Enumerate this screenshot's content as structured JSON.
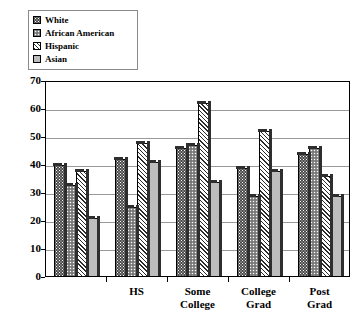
{
  "chart_data": {
    "type": "bar",
    "title": "",
    "subtitle": "",
    "xlabel": "",
    "ylabel": "",
    "categories": [
      "<HS",
      "HS",
      "Some College",
      "College Grad",
      "Post Grad"
    ],
    "category_lines": [
      [
        "<HS"
      ],
      [
        "HS"
      ],
      [
        "Some",
        "College"
      ],
      [
        "College",
        "Grad"
      ],
      [
        "Post",
        "Grad"
      ]
    ],
    "series": [
      {
        "name": "White",
        "pattern": "dark-dotted",
        "values": [
          40,
          42,
          46,
          39,
          44
        ]
      },
      {
        "name": "African American",
        "pattern": "medium-dotted",
        "values": [
          33,
          25,
          47,
          29,
          46
        ]
      },
      {
        "name": "Hispanic",
        "pattern": "diagonal-hatch",
        "values": [
          38,
          48,
          62,
          52,
          36
        ]
      },
      {
        "name": "Asian",
        "pattern": "solid-gray",
        "values": [
          21,
          41,
          34,
          38,
          29
        ]
      }
    ],
    "ylim": [
      0,
      70
    ],
    "yticks": [
      0,
      10,
      20,
      30,
      40,
      50,
      60,
      70
    ],
    "ytick_labels": [
      "0",
      "10",
      "20",
      "30",
      "40",
      "50",
      "60",
      "70"
    ],
    "grid": true,
    "legend_position": "top-left",
    "colors": {
      "white_series": "#4a4a4a",
      "african_american_series": "#8d8d8d",
      "hispanic_series": "#ffffff",
      "asian_series": "#bdbdbd",
      "axis": "#000000",
      "gridline": "#9a9a9a",
      "background": "#ffffff"
    }
  }
}
